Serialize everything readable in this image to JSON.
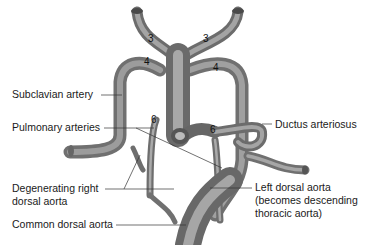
{
  "figure": {
    "arch_numbers": {
      "left_3": "3",
      "right_3": "3",
      "left_4": "4",
      "right_4": "4",
      "left_6": "6",
      "right_6": "6"
    },
    "labels": {
      "subclavian": "Subclavian artery",
      "pulmonary": "Pulmonary arteries",
      "ductus": "Ductus arteriosus",
      "degenerating_line1": "Degenerating right",
      "degenerating_line2": "dorsal aorta",
      "left_dorsal_line1": "Left dorsal aorta",
      "left_dorsal_line2": "(becomes descending",
      "left_dorsal_line3": "thoracic aorta)",
      "common_dorsal": "Common dorsal aorta"
    },
    "colors": {
      "vessel_dark": "#5a5a5a",
      "vessel_mid": "#8a8a8a",
      "vessel_light": "#c4c4c4",
      "leader_line": "#333333",
      "text": "#1a1a1a"
    }
  }
}
